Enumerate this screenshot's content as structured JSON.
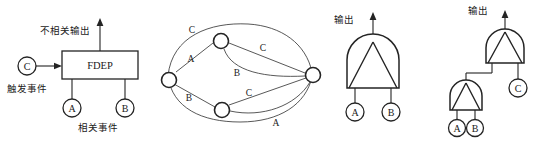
{
  "figure": {
    "background_color": "#ffffff",
    "line_color": "#242424",
    "panels": [
      {
        "id": "fdep-panel",
        "name": "functional-dependency-gate",
        "labels": {
          "output": "不相关输出",
          "trigger": "触发事件",
          "dependent": "相关事件",
          "box": "FDEP"
        },
        "nodes": [
          {
            "name": "trigger-node",
            "label": "C"
          },
          {
            "name": "dependent-node-a",
            "label": "A"
          },
          {
            "name": "dependent-node-b",
            "label": "B"
          }
        ]
      },
      {
        "id": "graph-panel",
        "name": "network-graph",
        "nodes": [
          {
            "name": "graph-node-left",
            "label": ""
          },
          {
            "name": "graph-node-top",
            "label": ""
          },
          {
            "name": "graph-node-bottom",
            "label": ""
          },
          {
            "name": "graph-node-right",
            "label": ""
          }
        ],
        "edge_labels": [
          {
            "name": "edge-label-c-top",
            "label": "C"
          },
          {
            "name": "edge-label-a-upper",
            "label": "A"
          },
          {
            "name": "edge-label-c-upper-right",
            "label": "C"
          },
          {
            "name": "edge-label-b-middle",
            "label": "B"
          },
          {
            "name": "edge-label-b-lower-left",
            "label": "B"
          },
          {
            "name": "edge-label-c-lower",
            "label": "C"
          },
          {
            "name": "edge-label-a-bottom",
            "label": "A"
          }
        ]
      },
      {
        "id": "and-gate-panel",
        "name": "and-gate",
        "labels": {
          "output": "输出"
        },
        "nodes": [
          {
            "name": "input-node-a",
            "label": "A"
          },
          {
            "name": "input-node-b",
            "label": "B"
          }
        ]
      },
      {
        "id": "nested-gate-panel",
        "name": "nested-and-gate",
        "labels": {
          "output": "输出"
        },
        "nodes": [
          {
            "name": "input-node-c",
            "label": "C"
          },
          {
            "name": "input-node-a",
            "label": "A"
          },
          {
            "name": "input-node-b",
            "label": "B"
          }
        ]
      }
    ]
  }
}
